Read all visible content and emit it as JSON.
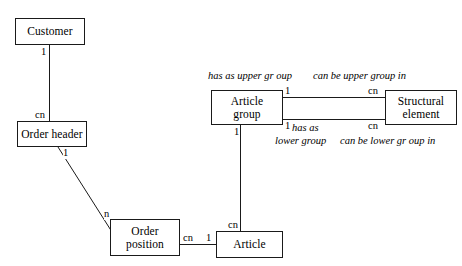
{
  "diagram": {
    "background_color": "#ffffff",
    "line_color": "#1a1a1a",
    "text_color": "#000000"
  },
  "entities": [
    {
      "id": "customer",
      "label": "Customer",
      "line1": "Customer",
      "line2": ""
    },
    {
      "id": "order-header",
      "label": "Order header",
      "line1": "Order header",
      "line2": ""
    },
    {
      "id": "order-position",
      "label": "Order position",
      "line1": "Order",
      "line2": "position"
    },
    {
      "id": "article",
      "label": "Article",
      "line1": "Article",
      "line2": ""
    },
    {
      "id": "article-group",
      "label": "Article group",
      "line1": "Article",
      "line2": "group"
    },
    {
      "id": "structural-element",
      "label": "Structural element",
      "line1": "Structural",
      "line2": "element"
    }
  ],
  "cardinalities": {
    "customer_to_orderheader_top": "1",
    "customer_to_orderheader_bottom": "cn",
    "orderheader_to_orderposition_start": "1",
    "orderheader_to_orderposition_end": "n",
    "orderposition_to_article_left": "cn",
    "orderposition_to_article_right": "1",
    "articlegroup_to_article_top": "1",
    "articlegroup_to_article_bottom": "cn",
    "articlegroup_upper_left": "1",
    "articlegroup_upper_right": "cn",
    "articlegroup_lower_left": "1",
    "articlegroup_lower_right": "cn"
  },
  "relationship_labels": {
    "has_as_upper_group": "has as upper gr oup",
    "can_be_upper_group_in": "can be upper group in",
    "has_as_lower_group_line1": "has as",
    "has_as_lower_group_line2": "lower group",
    "can_be_lower_group_in": "can be lower gr oup in"
  }
}
